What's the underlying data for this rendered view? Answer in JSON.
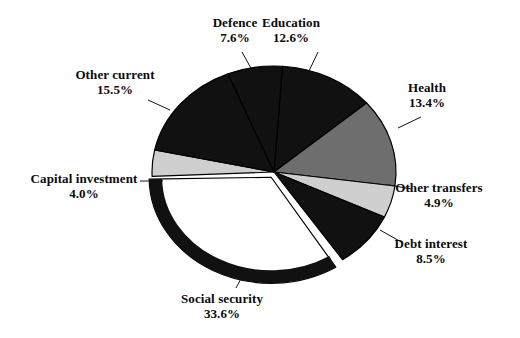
{
  "chart_data": {
    "type": "pie",
    "title": "",
    "subtitle": "",
    "xlabel": "",
    "ylabel": "",
    "legend_position": "none",
    "grid": false,
    "units": "percent",
    "value_suffix": "%",
    "categories": [
      "Education",
      "Health",
      "Other transfers",
      "Debt interest",
      "Social security",
      "Capital investment",
      "Other current",
      "Defence"
    ],
    "values": [
      12.6,
      13.4,
      4.9,
      8.5,
      33.6,
      4.0,
      15.5,
      7.6
    ],
    "slices": [
      {
        "label": "Education",
        "value": 12.6,
        "value_text": "12.6%",
        "fill": "#111111",
        "start_angle": 4,
        "end_angle": 49.4,
        "label_x": 291,
        "label_y": 16,
        "leader_from_x": 318,
        "leader_from_y": 52,
        "leader_to_x": 309,
        "leader_to_y": 71
      },
      {
        "label": "Health",
        "value": 13.4,
        "value_text": "13.4%",
        "fill": "#6e6e6e",
        "start_angle": 49.4,
        "end_angle": 97.6,
        "label_x": 427,
        "label_y": 81,
        "leader_from_x": 421,
        "leader_from_y": 117,
        "leader_to_x": 398,
        "leader_to_y": 128
      },
      {
        "label": "Other transfers",
        "value": 4.9,
        "value_text": "4.9%",
        "fill": "#cfcfcf",
        "start_angle": 97.6,
        "end_angle": 115.2,
        "label_x": 439,
        "label_y": 181,
        "leader_from_x": 412,
        "leader_from_y": 189,
        "leader_to_x": 389,
        "leader_to_y": 185
      },
      {
        "label": "Debt interest",
        "value": 8.5,
        "value_text": "8.5%",
        "fill": "#111111",
        "start_angle": 115.2,
        "end_angle": 145.8,
        "label_x": 431,
        "label_y": 237,
        "leader_from_x": 403,
        "leader_from_y": 243,
        "leader_to_x": 380,
        "leader_to_y": 230
      },
      {
        "label": "Social security",
        "value": 33.6,
        "value_text": "33.6%",
        "fill": "#ffffff",
        "start_angle": 148,
        "end_angle": 269,
        "label_x": 222,
        "label_y": 292,
        "leader_from_x": 236,
        "leader_from_y": 288,
        "leader_to_x": 243,
        "leader_to_y": 275
      },
      {
        "label": "Capital investment",
        "value": 4.0,
        "value_text": "4.0%",
        "fill": "#cfcfcf",
        "start_angle": 267.6,
        "end_angle": 282,
        "label_x": 84,
        "label_y": 172,
        "leader_from_x": 140,
        "leader_from_y": 181,
        "leader_to_x": 163,
        "leader_to_y": 181
      },
      {
        "label": "Other current",
        "value": 15.5,
        "value_text": "15.5%",
        "fill": "#111111",
        "start_angle": 282,
        "end_angle": 337.8,
        "label_x": 115,
        "label_y": 68,
        "leader_from_x": 148,
        "leader_from_y": 100,
        "leader_to_x": 170,
        "leader_to_y": 110
      },
      {
        "label": "Defence",
        "value": 7.6,
        "value_text": "7.6%",
        "fill": "#111111",
        "start_angle": 337.8,
        "end_angle": 4,
        "label_x": 235,
        "label_y": 16,
        "leader_from_x": 242,
        "leader_from_y": 52,
        "leader_to_x": 252,
        "leader_to_y": 70
      }
    ],
    "geometry": {
      "center_x": 274,
      "center_y": 172,
      "radius_x": 122,
      "radius_y": 106,
      "exploded_slice": "Social security",
      "explode_offset": 6,
      "outline_color": "#000000",
      "outline_width": 1.2,
      "social_ring_color": "#111111",
      "social_ring_width": 13
    },
    "colors": {
      "dark": "#111111",
      "medium_gray": "#6e6e6e",
      "light_gray": "#cfcfcf",
      "white": "#ffffff",
      "background": "#ffffff"
    }
  }
}
